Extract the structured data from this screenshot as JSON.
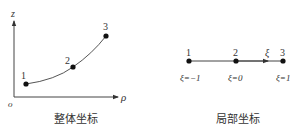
{
  "global_diagram": {
    "caption": "整体坐标",
    "axes": {
      "vertical": "z",
      "horizontal": "ρ",
      "origin": "o"
    },
    "nodes": [
      {
        "label": "1"
      },
      {
        "label": "2"
      },
      {
        "label": "3"
      }
    ]
  },
  "local_diagram": {
    "caption": "局部坐标",
    "axis_label": "ξ",
    "nodes": [
      {
        "label": "1",
        "coord": "ξ=−1"
      },
      {
        "label": "2",
        "coord": "ξ=0"
      },
      {
        "label": "3",
        "coord": "ξ=1"
      }
    ]
  },
  "colors": {
    "stroke": "#333333",
    "background": "#ffffff"
  }
}
